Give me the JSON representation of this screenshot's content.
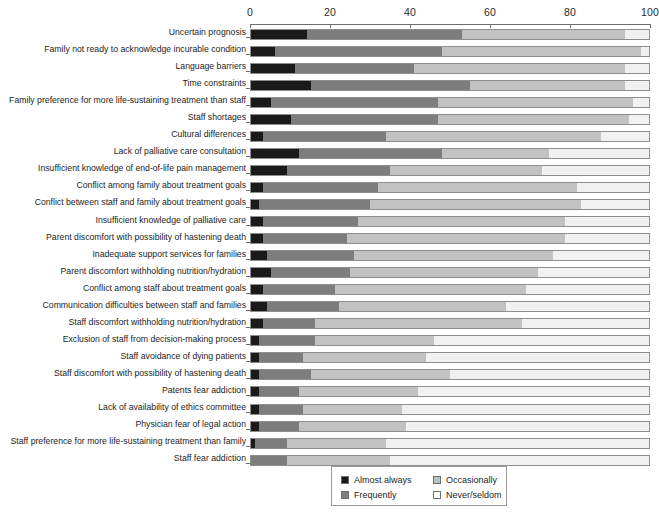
{
  "chart_data": {
    "type": "bar",
    "subtype": "horizontal-stacked-100",
    "title": "",
    "xlabel": "",
    "ylabel": "",
    "xlim": [
      0,
      100
    ],
    "xticks": [
      "0",
      "20",
      "40",
      "60",
      "80",
      "100"
    ],
    "grid": false,
    "legend_position": "bottom-center",
    "legend": [
      "Almost always",
      "Frequently",
      "Occasionally",
      "Never/seldom"
    ],
    "colors": {
      "almost_always": "#1a1a1a",
      "frequently": "#7d7d7d",
      "occasionally": "#c2c2c2",
      "never_seldom": "#f1f1f1",
      "axis": "#6d6d6d",
      "bar_outline": "#8e8e8e"
    },
    "categories": [
      "Uncertain prognosis",
      "Family not ready to acknowledge incurable condition",
      "Language barriers",
      "Time constraints",
      "Family preference for more life-sustaining treatment than staff",
      "Staff shortages",
      "Cultural differences",
      "Lack of palliative care consultation",
      "Insufficient knowledge of end-of-life pain management",
      "Conflict among family about treatment goals",
      "Conflict between staff and family about treatment goals",
      "Insufficient knowledge of palliative care",
      "Parent discomfort with possibility of hastening death",
      "Inadequate support services for families",
      "Parent discomfort withholding nutrition/hydration",
      "Conflict among staff about treatment goals",
      "Communication difficulties between staff and families",
      "Staff discomfort withholding nutrition/hydration",
      "Exclusion of staff from decision-making process",
      "Staff avoidance of dying patients",
      "Staff discomfort with possibility of hastening death",
      "Patents fear addiction",
      "Lack of availability of ethics committee",
      "Physician fear of legal action",
      "Staff preference for more life-sustaining treatment than family",
      "Staff fear addiction"
    ],
    "series": [
      {
        "name": "Almost always",
        "values": [
          14,
          6,
          11,
          15,
          5,
          10,
          3,
          12,
          9,
          3,
          2,
          3,
          3,
          4,
          5,
          3,
          4,
          3,
          2,
          2,
          2,
          2,
          2,
          2,
          1,
          0
        ]
      },
      {
        "name": "Frequently",
        "values": [
          39,
          42,
          30,
          40,
          42,
          37,
          31,
          36,
          26,
          29,
          28,
          24,
          21,
          22,
          20,
          18,
          18,
          13,
          14,
          11,
          13,
          10,
          11,
          10,
          8,
          9
        ]
      },
      {
        "name": "Occasionally",
        "values": [
          41,
          50,
          53,
          39,
          49,
          48,
          54,
          27,
          38,
          50,
          53,
          52,
          55,
          50,
          47,
          48,
          42,
          52,
          30,
          31,
          35,
          30,
          25,
          27,
          25,
          26
        ]
      },
      {
        "name": "Never/seldom",
        "values": [
          6,
          2,
          6,
          6,
          4,
          5,
          12,
          25,
          27,
          18,
          17,
          21,
          21,
          24,
          28,
          31,
          36,
          32,
          54,
          56,
          50,
          58,
          62,
          61,
          66,
          65
        ]
      }
    ]
  },
  "axis": {
    "ticks": [
      {
        "label": "0",
        "value": 0
      },
      {
        "label": "20",
        "value": 20
      },
      {
        "label": "40",
        "value": 40
      },
      {
        "label": "60",
        "value": 60
      },
      {
        "label": "80",
        "value": 80
      },
      {
        "label": "100",
        "value": 100
      }
    ]
  },
  "legend": {
    "items": [
      {
        "label": "Almost always",
        "swatch": "sw0"
      },
      {
        "label": "Occasionally",
        "swatch": "sw2"
      },
      {
        "label": "Frequently",
        "swatch": "sw1"
      },
      {
        "label": "Never/seldom",
        "swatch": "sw3"
      }
    ]
  }
}
